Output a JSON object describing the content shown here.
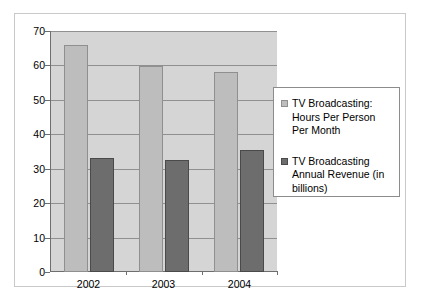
{
  "chart_data": {
    "type": "bar",
    "title": "",
    "subtitle": "",
    "xlabel": "",
    "ylabel": "",
    "categories": [
      "2002",
      "2003",
      "2004"
    ],
    "series": [
      {
        "name": "TV Broadcasting: Hours Per Person Per Month",
        "color": "#bdbdbd",
        "values": [
          66,
          59.7,
          58
        ]
      },
      {
        "name": "TV Broadcasting Annual Revenue (in billions)",
        "color": "#6d6d6d",
        "values": [
          33,
          32.5,
          35.5
        ]
      }
    ],
    "ylim": [
      0,
      70
    ],
    "ytick_values": [
      0,
      10,
      20,
      30,
      40,
      50,
      60,
      70
    ],
    "ytick_labels": [
      "0",
      "10",
      "20",
      "30",
      "40",
      "50",
      "60",
      "70"
    ],
    "grid": true,
    "grid_axis": "y",
    "legend_position": "right",
    "plot_background": "#d5d5d5",
    "figure_background": "#ffffff",
    "gridline_color": "#909090",
    "axis_color": "#6e6e6e",
    "frame_color": "#c9c9c9"
  }
}
